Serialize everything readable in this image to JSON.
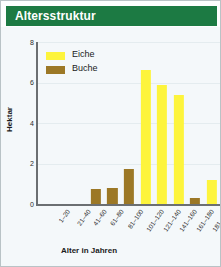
{
  "header": {
    "title": "Altersstruktur",
    "background_color": "#1c7a43",
    "text_color": "#ffffff"
  },
  "panel": {
    "background_color": "#f4f8fa",
    "border_color": "#b9c3c6"
  },
  "legend": {
    "position": "top-left",
    "entries": [
      {
        "label": "Eiche",
        "color": "#fdf43c"
      },
      {
        "label": "Buche",
        "color": "#9c7826"
      }
    ]
  },
  "axes": {
    "y_title": "Hektar",
    "x_title": "Alter in Jahren",
    "y_ticks": [
      "0",
      "2",
      "4",
      "6",
      "8"
    ]
  },
  "chart_data": {
    "type": "bar",
    "title": "Altersstruktur",
    "xlabel": "Alter in Jahren",
    "ylabel": "Hektar",
    "ylim": [
      0,
      8
    ],
    "yticks": [
      0,
      2,
      4,
      6,
      8
    ],
    "grid": true,
    "legend_position": "top-left",
    "categories": [
      "1-20",
      "21-40",
      "41-60",
      "61-80",
      "81-100",
      "101-120",
      "121-140",
      "141-160",
      "161-180",
      "181-200",
      ">200"
    ],
    "series": [
      {
        "name": "Eiche",
        "color": "#fdf43c",
        "values": [
          0,
          0,
          0,
          0,
          0,
          0,
          6.6,
          5.9,
          5.4,
          0,
          1.2
        ]
      },
      {
        "name": "Buche",
        "color": "#9c7826",
        "values": [
          0,
          0,
          0,
          0.75,
          0.8,
          1.75,
          0,
          0,
          0,
          0.3,
          0
        ]
      }
    ]
  }
}
